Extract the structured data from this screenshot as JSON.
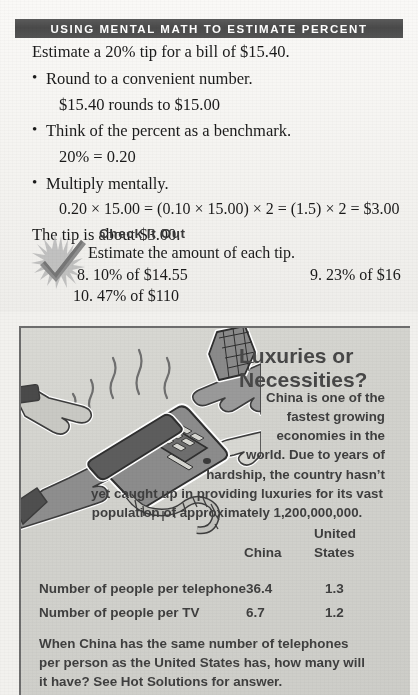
{
  "header": {
    "title": "USING MENTAL MATH TO ESTIMATE PERCENT",
    "band_color": "#4f4f4f",
    "text_color": "#ffffff"
  },
  "lesson": {
    "intro": "Estimate a 20% tip for a bill of $15.40.",
    "bullet1": "Round to a convenient number.",
    "bullet1_detail": "$15.40 rounds to $15.00",
    "bullet2": "Think of the percent as a benchmark.",
    "bullet2_detail": "20% = 0.20",
    "bullet3": "Multiply mentally.",
    "bullet3_detail": "0.20 × 15.00 = (0.10 × 15.00) × 2 = (1.5) × 2 = $3.00",
    "conclusion": "The tip is about $3.00.",
    "bullet_glyph": "•"
  },
  "check_it_out": {
    "heading": "Check It Out",
    "instruction": "Estimate the amount of each tip.",
    "exercises": [
      {
        "number": "8.",
        "text": "10% of $14.55"
      },
      {
        "number": "9.",
        "text": "23% of $16"
      },
      {
        "number": "10.",
        "text": "47% of $110"
      }
    ],
    "ex8": "8. 10% of $14.55",
    "ex9": "9. 23% of $16",
    "ex10": "10. 47% of $110",
    "icon": "checkmark-starburst-icon"
  },
  "feature_panel": {
    "title_line1": "Luxuries or",
    "title_line2": "Necessities?",
    "paragraph_lines": [
      "China is one of the",
      "fastest growing",
      "economies in the",
      "world. Due to years of",
      "hardship, the country hasn’t",
      "yet caught up in providing luxuries for its vast",
      "population of approximately 1,200,000,000."
    ],
    "paragraph_full": "China is one of the fastest growing economies in the world. Due to years of hardship, the country hasn’t yet caught up in providing luxuries for its vast population of approximately 1,200,000,000.",
    "illustration": "hands-reaching-for-ringing-telephone-illustration",
    "panel_color": "#d3d3ce",
    "border_color": "#6d6d6d",
    "table": {
      "col_header_1": "China",
      "col_header_2_line1": "United",
      "col_header_2_line2": "States",
      "rows": [
        {
          "label": "Number of people per telephone",
          "china": "36.4",
          "united_states": "1.3"
        },
        {
          "label": "Number of people per TV",
          "china": "6.7",
          "united_states": "1.2"
        }
      ]
    },
    "closing_lines": [
      "When China has the same number of telephones",
      "per person as the United States has, how many will",
      "it have? See Hot Solutions for answer."
    ],
    "closing_full": "When China has the same number of telephones per person as the United States has, how many will it have? See Hot Solutions for answer."
  }
}
